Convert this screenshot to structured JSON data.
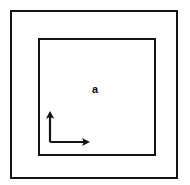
{
  "figure": {
    "type": "technical-diagram",
    "background_color": "#ffffff",
    "line_color": "#141414"
  },
  "outer_frame": {
    "name": "outer boundary",
    "x": 11,
    "y": 11,
    "width": 166,
    "height": 167,
    "stroke_width": 2
  },
  "inner_frame": {
    "name": "inner boundary",
    "x": 39,
    "y": 39,
    "width": 116,
    "height": 116,
    "stroke_width": 2
  },
  "labels": {
    "region": "a",
    "region_x": 95,
    "region_y": 93
  },
  "axes": {
    "origin_x": 50,
    "origin_y": 142,
    "vertical_tip_x": 50,
    "vertical_tip_y": 111,
    "horizontal_tip_x": 90,
    "horizontal_tip_y": 142,
    "arrow_size": 5
  }
}
